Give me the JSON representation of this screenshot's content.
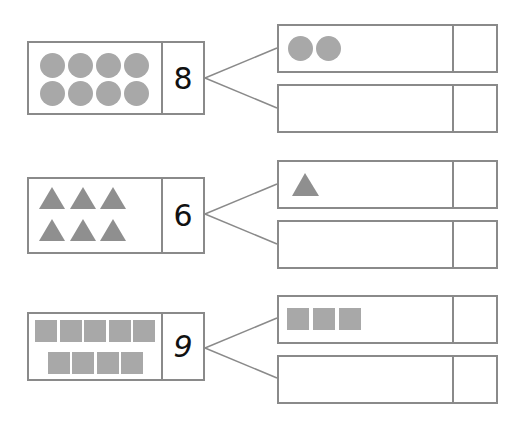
{
  "worksheet": {
    "rows": [
      {
        "number": "8",
        "shape": "circle",
        "total_count": 8,
        "given_part_count": 2,
        "missing_part_count": "",
        "given_part_value": "",
        "colors": {
          "shape": "#a8a8a8",
          "border": "#8a8a8a"
        }
      },
      {
        "number": "6",
        "shape": "triangle",
        "total_count": 6,
        "given_part_count": 1,
        "missing_part_count": "",
        "given_part_value": "",
        "colors": {
          "shape": "#8f8f8f",
          "border": "#8a8a8a"
        }
      },
      {
        "number": "9",
        "shape": "square",
        "total_count": 9,
        "given_part_count": 3,
        "missing_part_count": "",
        "given_part_value": "",
        "colors": {
          "shape": "#a8a8a8",
          "border": "#8a8a8a"
        }
      }
    ]
  }
}
